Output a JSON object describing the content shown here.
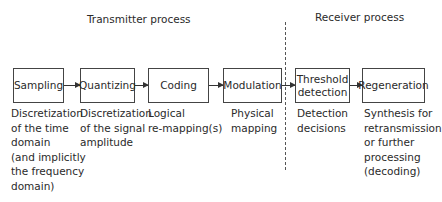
{
  "headers": {
    "transmitter": "Transmitter process",
    "receiver": "Receiver process"
  },
  "stages": [
    {
      "label": "Sampling",
      "description": "Discretization\nof the time\ndomain\n(and implicitly\nthe frequency\ndomain)"
    },
    {
      "label": "Quantizing",
      "description": "Discretization\nof the signal\namplitude"
    },
    {
      "label": "Coding",
      "description": "Logical\nre-mapping(s)"
    },
    {
      "label": "Modulation",
      "description": "Physical\nmapping"
    },
    {
      "label": "Threshold\ndetection",
      "description": "Detection\ndecisions"
    },
    {
      "label": "Regeneration",
      "description": "Synthesis for\nretransmission\nor further\nprocessing\n(decoding)"
    }
  ]
}
